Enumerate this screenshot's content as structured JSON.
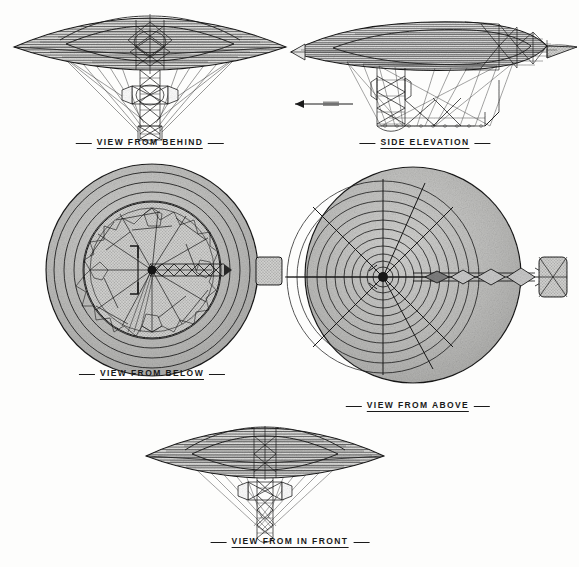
{
  "document": {
    "type": "orthographic-projection-drawing",
    "subject": "flying saucer airship",
    "background_color": "#fdfdfc",
    "ink_color": "#1a1a1a",
    "halftone_fill": "#b8b8b8"
  },
  "views": [
    {
      "id": "view-from-behind",
      "caption": "VIEW FROM BEHIND",
      "projection": "rear elevation",
      "center_x": 150,
      "caption_y": 141
    },
    {
      "id": "side-elevation",
      "caption": "SIDE ELEVATION",
      "projection": "side elevation",
      "center_x": 425,
      "caption_y": 141
    },
    {
      "id": "view-from-below",
      "caption": "VIEW FROM BELOW",
      "projection": "plan from below",
      "center_x": 152,
      "caption_y": 374
    },
    {
      "id": "view-from-above",
      "caption": "VIEW FROM ABOVE",
      "projection": "plan from above",
      "center_x": 418,
      "caption_y": 400
    },
    {
      "id": "view-from-in-front",
      "caption": "VIEW FROM IN FRONT",
      "projection": "front elevation",
      "center_x": 290,
      "caption_y": 536
    }
  ],
  "annotations": {
    "direction_arrow": {
      "label": "",
      "description": "leftward direction-of-travel arrow on side elevation"
    }
  }
}
